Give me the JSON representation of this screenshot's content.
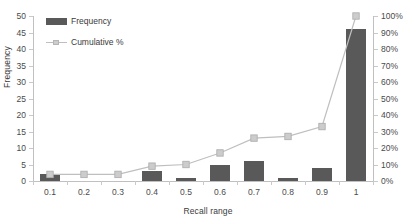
{
  "chart_data": {
    "type": "bar",
    "title": "",
    "subtitle": "",
    "xlabel": "Recall range",
    "ylabel": "Frequency",
    "y2label": "",
    "categories": [
      "0.1",
      "0.2",
      "0.3",
      "0.4",
      "0.5",
      "0.6",
      "0.7",
      "0.8",
      "0.9",
      "1"
    ],
    "series": [
      {
        "name": "Frequency",
        "type": "bar",
        "axis": "left",
        "color": "#595959",
        "values": [
          2,
          0,
          0,
          3,
          1,
          5,
          6,
          1,
          4,
          46
        ]
      },
      {
        "name": "Cumulative %",
        "type": "line",
        "axis": "right",
        "color": "#bfbfbf",
        "marker_color": "#cccccc",
        "values": [
          4,
          4,
          4,
          9,
          10,
          17,
          26,
          27,
          33,
          100
        ]
      }
    ],
    "ylim": [
      0,
      50
    ],
    "yticks": [
      "0",
      "5",
      "10",
      "15",
      "20",
      "25",
      "30",
      "35",
      "40",
      "45",
      "50"
    ],
    "y2lim": [
      0,
      100
    ],
    "y2ticks": [
      "0%",
      "10%",
      "20%",
      "30%",
      "40%",
      "50%",
      "60%",
      "70%",
      "80%",
      "90%",
      "100%"
    ],
    "grid": false,
    "legend_position": "top-left",
    "legend": [
      "Frequency",
      "Cumulative %"
    ]
  },
  "legend": {
    "frequency_label": "Frequency",
    "cumulative_label": "Cumulative %"
  },
  "axes": {
    "x_title": "Recall range",
    "y_title": "Frequency"
  }
}
